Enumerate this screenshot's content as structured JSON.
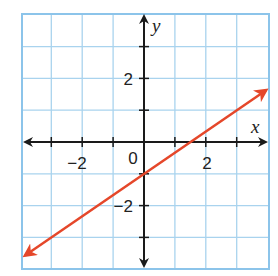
{
  "chart_data": {
    "type": "line",
    "title": "",
    "xlabel": "x",
    "ylabel": "y",
    "xlim": [
      -4,
      4
    ],
    "ylim": [
      -4,
      4
    ],
    "grid": true,
    "grid_step": 1,
    "x_ticks": [
      -2,
      0,
      2
    ],
    "y_ticks": [
      2,
      -2
    ],
    "tick_labels": {
      "x_neg2": "−2",
      "origin": "0",
      "x_pos2": "2",
      "y_pos2": "2",
      "y_neg2": "−2"
    },
    "series": [
      {
        "name": "line",
        "equation": "y = (2/3)x - 1",
        "slope": 0.6667,
        "y_intercept": -1,
        "x_intercept": 1.5,
        "x": [
          -3.85,
          0,
          1.5,
          3.95
        ],
        "y": [
          -3.57,
          -1,
          0,
          1.63
        ],
        "arrows_both_ends": true,
        "color": "#e5472a"
      }
    ]
  },
  "colors": {
    "grid": "#a9d3ee",
    "border": "#8cc4ea",
    "axis": "#1a1a1a",
    "line": "#e5472a"
  }
}
